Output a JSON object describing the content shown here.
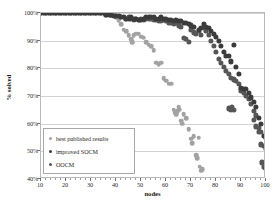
{
  "chart_data": {
    "type": "scatter",
    "title": "",
    "xlabel": "nodes",
    "ylabel": "% solved",
    "xlim": [
      10,
      100
    ],
    "ylim": [
      40,
      100
    ],
    "xticks": [
      10,
      20,
      30,
      40,
      50,
      60,
      70,
      80,
      90,
      100
    ],
    "xtick_labels": [
      "10",
      "20",
      "30",
      "40",
      "50",
      "60",
      "70",
      "80",
      "90",
      "100"
    ],
    "yticks": [
      40,
      50,
      60,
      70,
      80,
      90,
      100
    ],
    "ytick_labels": [
      "40%",
      "50%",
      "60%",
      "70%",
      "80%",
      "90%",
      "100%"
    ],
    "grid": "horizontal",
    "legend_position": "lower-left-inside",
    "series": [
      {
        "name": "best published results",
        "color": "#a2a2a2",
        "points": [
          [
            10,
            100
          ],
          [
            11,
            100
          ],
          [
            12,
            100
          ],
          [
            13,
            100
          ],
          [
            14,
            100
          ],
          [
            15,
            100
          ],
          [
            16,
            100
          ],
          [
            17,
            100
          ],
          [
            18,
            100
          ],
          [
            19,
            100
          ],
          [
            20,
            100
          ],
          [
            21,
            100
          ],
          [
            22,
            100
          ],
          [
            23,
            100
          ],
          [
            24,
            100
          ],
          [
            25,
            100
          ],
          [
            26,
            100
          ],
          [
            27,
            100
          ],
          [
            28,
            100
          ],
          [
            29,
            100
          ],
          [
            30,
            100
          ],
          [
            31,
            100
          ],
          [
            32,
            100
          ],
          [
            33,
            100
          ],
          [
            34,
            100
          ],
          [
            35,
            100
          ],
          [
            36,
            100
          ],
          [
            37,
            99.5
          ],
          [
            38,
            99
          ],
          [
            39,
            99
          ],
          [
            40,
            98.5
          ],
          [
            41,
            97.5
          ],
          [
            42,
            96
          ],
          [
            43,
            94
          ],
          [
            44,
            93.5
          ],
          [
            45,
            92
          ],
          [
            46,
            90.5
          ],
          [
            46.5,
            89.5
          ],
          [
            47,
            92
          ],
          [
            48,
            92.5
          ],
          [
            49,
            92.5
          ],
          [
            50,
            91.5
          ],
          [
            51,
            91
          ],
          [
            52,
            89.5
          ],
          [
            53,
            88.5
          ],
          [
            54,
            88
          ],
          [
            55,
            86.5
          ],
          [
            56,
            82
          ],
          [
            57,
            81.5
          ],
          [
            58,
            82
          ],
          [
            59,
            76.5
          ],
          [
            60,
            75.5
          ],
          [
            61,
            74.5
          ],
          [
            62,
            74.5
          ],
          [
            63,
            65
          ],
          [
            63.5,
            64
          ],
          [
            64,
            63.5
          ],
          [
            64.5,
            64.5
          ],
          [
            65,
            66
          ],
          [
            65.5,
            65
          ],
          [
            66,
            61
          ],
          [
            66.5,
            60
          ],
          [
            67,
            63.5
          ],
          [
            68,
            62
          ],
          [
            69,
            58
          ],
          [
            70,
            54.5
          ],
          [
            70.5,
            53
          ],
          [
            71,
            55.5
          ],
          [
            72,
            48.5
          ],
          [
            72.5,
            47.5
          ],
          [
            73,
            55
          ],
          [
            73.5,
            44.5
          ],
          [
            74,
            43
          ],
          [
            74.5,
            43.5
          ]
        ]
      },
      {
        "name": "improved SOCM",
        "color": "#3b3b3b",
        "points": [
          [
            10,
            100
          ],
          [
            11,
            100
          ],
          [
            12,
            100
          ],
          [
            13,
            100
          ],
          [
            14,
            100
          ],
          [
            15,
            100
          ],
          [
            16,
            100
          ],
          [
            17,
            100
          ],
          [
            18,
            100
          ],
          [
            19,
            100
          ],
          [
            20,
            100
          ],
          [
            21,
            100
          ],
          [
            22,
            100
          ],
          [
            23,
            100
          ],
          [
            24,
            100
          ],
          [
            25,
            100
          ],
          [
            26,
            100
          ],
          [
            27,
            100
          ],
          [
            28,
            100
          ],
          [
            29,
            100
          ],
          [
            30,
            100
          ],
          [
            31,
            100
          ],
          [
            32,
            100
          ],
          [
            33,
            100
          ],
          [
            34,
            100
          ],
          [
            35,
            100
          ],
          [
            36,
            99.5
          ],
          [
            37,
            99.5
          ],
          [
            38,
            99.5
          ],
          [
            39,
            99
          ],
          [
            40,
            99
          ],
          [
            41,
            99
          ],
          [
            42,
            98.5
          ],
          [
            43,
            98.5
          ],
          [
            44,
            98
          ],
          [
            45,
            98
          ],
          [
            46,
            98.5
          ],
          [
            47,
            98
          ],
          [
            48,
            98
          ],
          [
            49,
            97.5
          ],
          [
            50,
            97.5
          ],
          [
            51,
            98
          ],
          [
            52,
            98.5
          ],
          [
            53,
            98.5
          ],
          [
            54,
            98.5
          ],
          [
            55,
            98.5
          ],
          [
            56,
            98
          ],
          [
            57,
            98
          ],
          [
            58,
            98.5
          ],
          [
            59,
            98
          ],
          [
            60,
            98
          ],
          [
            61,
            97.5
          ],
          [
            62,
            97.5
          ],
          [
            63,
            97
          ],
          [
            64,
            97.5
          ],
          [
            65,
            97
          ],
          [
            66,
            97
          ],
          [
            67,
            96.5
          ],
          [
            68,
            96.5
          ],
          [
            69,
            96
          ],
          [
            70,
            95.5
          ],
          [
            71,
            95
          ],
          [
            72,
            101
          ],
          [
            73,
            94
          ],
          [
            74,
            94.5
          ],
          [
            75,
            96
          ],
          [
            76,
            95
          ],
          [
            77,
            94.5
          ],
          [
            78,
            93.5
          ],
          [
            79,
            92.5
          ],
          [
            80,
            91.5
          ],
          [
            81,
            90
          ],
          [
            82,
            88
          ],
          [
            83,
            86
          ],
          [
            84,
            84.5
          ],
          [
            85,
            84.5
          ],
          [
            86,
            82.5
          ],
          [
            87,
            88.5
          ],
          [
            88,
            80.5
          ],
          [
            89,
            78
          ],
          [
            90,
            73
          ],
          [
            91,
            72.5
          ],
          [
            92,
            72.5
          ],
          [
            93,
            71
          ],
          [
            94,
            69.5
          ],
          [
            95,
            68
          ],
          [
            96,
            66
          ],
          [
            97,
            62
          ],
          [
            98,
            60
          ],
          [
            99,
            55.5
          ],
          [
            100,
            55
          ]
        ]
      },
      {
        "name": "OOCM",
        "color": "#565656",
        "points": [
          [
            10,
            100
          ],
          [
            12,
            100
          ],
          [
            14,
            100
          ],
          [
            16,
            100
          ],
          [
            18,
            100
          ],
          [
            20,
            100
          ],
          [
            22,
            100
          ],
          [
            24,
            100
          ],
          [
            26,
            100
          ],
          [
            28,
            100
          ],
          [
            30,
            100
          ],
          [
            32,
            100
          ],
          [
            34,
            100
          ],
          [
            36,
            99.5
          ],
          [
            38,
            99.5
          ],
          [
            40,
            99
          ],
          [
            42,
            98.5
          ],
          [
            44,
            98
          ],
          [
            45,
            98.5
          ],
          [
            46,
            98
          ],
          [
            47,
            97.5
          ],
          [
            48,
            98
          ],
          [
            49,
            97.5
          ],
          [
            50,
            98
          ],
          [
            51,
            97.5
          ],
          [
            52,
            98
          ],
          [
            53,
            98
          ],
          [
            54,
            98
          ],
          [
            55,
            97.5
          ],
          [
            56,
            97.5
          ],
          [
            57,
            97
          ],
          [
            58,
            97
          ],
          [
            59,
            97.5
          ],
          [
            60,
            97
          ],
          [
            61,
            96.5
          ],
          [
            62,
            96.5
          ],
          [
            63,
            96
          ],
          [
            64,
            96.5
          ],
          [
            65,
            95.5
          ],
          [
            66,
            95
          ],
          [
            67,
            91
          ],
          [
            68,
            90.5
          ],
          [
            69,
            89.5
          ],
          [
            70,
            94
          ],
          [
            71,
            93
          ],
          [
            72,
            92.5
          ],
          [
            73,
            93.5
          ],
          [
            74,
            92
          ],
          [
            75,
            94.5
          ],
          [
            76,
            93.5
          ],
          [
            77,
            92
          ],
          [
            78,
            90
          ],
          [
            79,
            88
          ],
          [
            80,
            86
          ],
          [
            81,
            83.5
          ],
          [
            82,
            82
          ],
          [
            83,
            80.5
          ],
          [
            84,
            79
          ],
          [
            85,
            78
          ],
          [
            86,
            76.5
          ],
          [
            87,
            76
          ],
          [
            88,
            75.5
          ],
          [
            89,
            74.5
          ],
          [
            90,
            72
          ],
          [
            91,
            71
          ],
          [
            92,
            70
          ],
          [
            93,
            69
          ],
          [
            94,
            67
          ],
          [
            95,
            64.5
          ],
          [
            96,
            63
          ],
          [
            97,
            58.5
          ],
          [
            98,
            57
          ],
          [
            99,
            52
          ],
          [
            100,
            51
          ],
          [
            85,
            65.5
          ],
          [
            86,
            65
          ],
          [
            86.5,
            66
          ],
          [
            87,
            65
          ],
          [
            95,
            61.5
          ],
          [
            96,
            59
          ],
          [
            97,
            57
          ],
          [
            98,
            52.5
          ],
          [
            99,
            44.5
          ],
          [
            99.5,
            44
          ],
          [
            100,
            45.5
          ],
          [
            98.5,
            46
          ]
        ]
      }
    ]
  },
  "legend": {
    "items": [
      {
        "label": "best published results",
        "color": "#a2a2a2"
      },
      {
        "label": "improved SOCM",
        "color": "#3b3b3b"
      },
      {
        "label": "OOCM",
        "color": "#565656"
      }
    ]
  }
}
